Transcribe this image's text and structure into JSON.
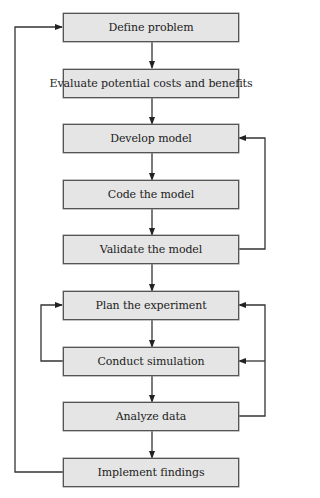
{
  "diagram": {
    "type": "flowchart",
    "steps": [
      {
        "id": "define",
        "label": "Define problem"
      },
      {
        "id": "evaluate",
        "label": "Evaluate potential costs and benefits"
      },
      {
        "id": "develop",
        "label": "Develop model"
      },
      {
        "id": "code",
        "label": "Code the model"
      },
      {
        "id": "validate",
        "label": "Validate the model"
      },
      {
        "id": "plan",
        "label": "Plan the experiment"
      },
      {
        "id": "conduct",
        "label": "Conduct simulation"
      },
      {
        "id": "analyze",
        "label": "Analyze data"
      },
      {
        "id": "implement",
        "label": "Implement findings"
      }
    ],
    "feedback_loops": [
      {
        "from": "validate",
        "to": "develop",
        "side": "right"
      },
      {
        "from": "conduct",
        "to": "plan",
        "side": "left"
      },
      {
        "from": "analyze",
        "to": "plan",
        "side": "right"
      },
      {
        "from": "analyze",
        "to": "conduct",
        "side": "right"
      },
      {
        "from": "implement",
        "to": "define",
        "side": "left"
      }
    ],
    "colors": {
      "box_fill": "#e5e5e5",
      "box_border": "#555555",
      "line": "#333333"
    }
  }
}
